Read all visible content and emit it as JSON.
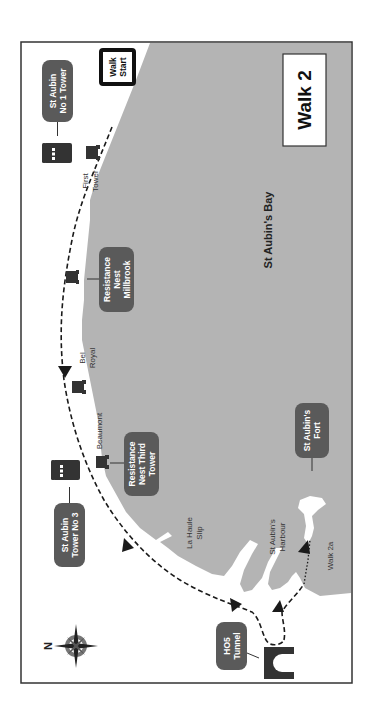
{
  "map": {
    "title": "Walk 2",
    "bay_label": "St Aubin's Bay",
    "start_label": [
      "Walk",
      "Start"
    ],
    "colors": {
      "sea": "#b4b4b4",
      "land": "#ffffff",
      "frame": "#333333",
      "pill": "#5a5a5a",
      "icon": "#333333",
      "route": "#1a1a1a"
    },
    "callouts": [
      {
        "id": "st-aubin-no1-tower",
        "lines": [
          "St Aubin",
          "No 1 Tower"
        ]
      },
      {
        "id": "resistance-nest-millbrook",
        "lines": [
          "Resistance",
          "Nest",
          "Millbrook"
        ]
      },
      {
        "id": "resistance-nest-third-tower",
        "lines": [
          "Resistance",
          "Nest Third",
          "Tower"
        ]
      },
      {
        "id": "st-aubin-tower-no3",
        "lines": [
          "St Aubin",
          "Tower No 3"
        ]
      },
      {
        "id": "st-aubins-fort",
        "lines": [
          "St Aubin's",
          "Fort"
        ]
      },
      {
        "id": "ho5-tunnel",
        "lines": [
          "HO5",
          "Tunnel"
        ]
      }
    ],
    "place_labels": [
      {
        "id": "first-tower",
        "lines": [
          "First",
          "Tower"
        ]
      },
      {
        "id": "bel-royal",
        "lines": [
          "Bel",
          "Royal"
        ]
      },
      {
        "id": "beaumont",
        "lines": [
          "Beaumont"
        ]
      },
      {
        "id": "la-haule-slip",
        "lines": [
          "La Haule",
          "Slip"
        ]
      },
      {
        "id": "st-aubins-harbour",
        "lines": [
          "St Aubin's",
          "Harbour"
        ]
      },
      {
        "id": "walk-2a",
        "lines": [
          "Walk 2a"
        ]
      }
    ],
    "compass": {
      "north_letter": "N"
    }
  }
}
